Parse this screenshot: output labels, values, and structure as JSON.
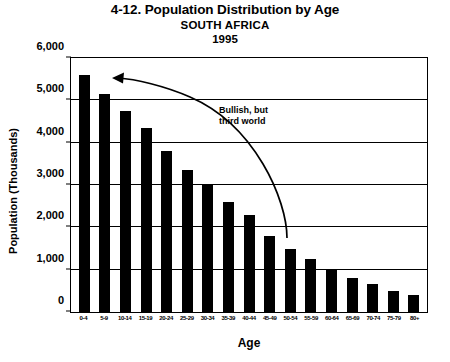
{
  "titles": {
    "main": "4-12. Population Distribution by Age",
    "subtitle": "SOUTH AFRICA",
    "year": "1995"
  },
  "annotation": {
    "line1": "Bullish, but",
    "line2": "third world"
  },
  "axes": {
    "ylabel": "Population (Thousands)",
    "xlabel": "Age",
    "yticks": [
      "6,000",
      "5,000",
      "4,000",
      "3,000",
      "2,000",
      "1,000",
      "0"
    ]
  },
  "colors": {
    "bar": "#000000",
    "grid": "#000000",
    "background": "#ffffff"
  },
  "chart_data": {
    "type": "bar",
    "xlabel": "Age",
    "ylabel": "Population (Thousands)",
    "ylim": [
      0,
      6000
    ],
    "ytick_values": [
      0,
      1000,
      2000,
      3000,
      4000,
      5000,
      6000
    ],
    "grid": true,
    "legend": "none",
    "categories": [
      "0-4",
      "5-9",
      "10-14",
      "15-19",
      "20-24",
      "25-29",
      "30-34",
      "35-39",
      "40-44",
      "45-49",
      "50-54",
      "55-59",
      "60-64",
      "65-69",
      "70-74",
      "75-79",
      "80+"
    ],
    "values": [
      5600,
      5150,
      4750,
      4350,
      3800,
      3350,
      3000,
      2600,
      2300,
      1800,
      1500,
      1250,
      1000,
      800,
      650,
      500,
      400
    ],
    "annotations": [
      {
        "text": "Bullish, but third world",
        "arrow": "curved arrow sweeping from the 45-49 bar up-left to the 5-9 / 0-4 bars"
      }
    ]
  }
}
